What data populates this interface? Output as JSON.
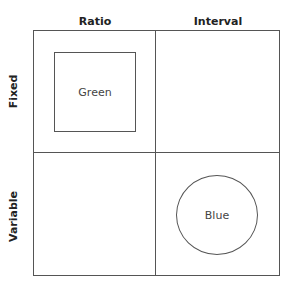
{
  "columns": [
    {
      "label": "Ratio"
    },
    {
      "label": "Interval"
    }
  ],
  "rows": [
    {
      "label": "Fixed"
    },
    {
      "label": "Variable"
    }
  ],
  "cells": {
    "fixed_ratio": {
      "shape": "square",
      "label": "Green"
    },
    "fixed_interval": {
      "shape": "none",
      "label": ""
    },
    "variable_ratio": {
      "shape": "none",
      "label": ""
    },
    "variable_interval": {
      "shape": "circle",
      "label": "Blue"
    }
  }
}
